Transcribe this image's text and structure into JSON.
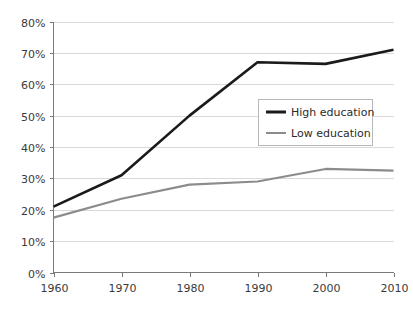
{
  "chart_data": {
    "type": "line",
    "title": "",
    "subtitle": "",
    "xlabel": "",
    "ylabel": "",
    "x": [
      1960,
      1970,
      1980,
      1990,
      2000,
      2010
    ],
    "categories": [
      "1960",
      "1970",
      "1980",
      "1990",
      "2000",
      "2010"
    ],
    "series": [
      {
        "name": "High education",
        "color": "#1a1a1a",
        "values": [
          21,
          31,
          50,
          67,
          66.5,
          71
        ]
      },
      {
        "name": "Low education",
        "color": "#8c8c8c",
        "values": [
          17.5,
          23.5,
          28,
          29,
          33,
          32.5
        ]
      }
    ],
    "ylim": [
      0,
      80
    ],
    "xlim": [
      1960,
      2010
    ],
    "y_ticks": [
      0,
      10,
      20,
      30,
      40,
      50,
      60,
      70,
      80
    ],
    "y_tick_labels": [
      "0%",
      "10%",
      "20%",
      "30%",
      "40%",
      "50%",
      "60%",
      "70%",
      "80%"
    ],
    "x_ticks": [
      1960,
      1970,
      1980,
      1990,
      2000,
      2010
    ],
    "x_tick_labels": [
      "1960",
      "1970",
      "1980",
      "1990",
      "2000",
      "2010"
    ],
    "grid": "horizontal",
    "legend_position": "center-right",
    "legend_entries": [
      "High education",
      "Low education"
    ]
  },
  "axis": {
    "y_labels": [
      "80%",
      "70%",
      "60%",
      "50%",
      "40%",
      "30%",
      "20%",
      "10%",
      "0%"
    ],
    "x_labels": [
      "1960",
      "1970",
      "1980",
      "1990",
      "2000",
      "2010"
    ]
  },
  "legend": {
    "items": [
      {
        "label": "High education",
        "color": "#1a1a1a"
      },
      {
        "label": "Low education",
        "color": "#8c8c8c"
      }
    ]
  },
  "colors": {
    "high_education": "#1a1a1a",
    "low_education": "#8c8c8c",
    "gridline": "#d9d9d9",
    "axis": "#7a7a7a",
    "background": "#ffffff"
  }
}
